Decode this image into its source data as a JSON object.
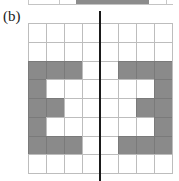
{
  "figure": {
    "label": "(b)",
    "colors": {
      "filled": "#8a8a8a",
      "empty": "#ffffff",
      "grid_line": "#bdbdbd",
      "symmetry_axis": "#1a1a1a"
    },
    "top_partial_panel": {
      "description": "bottom edge of previous panel (a) grid",
      "filled_span_px": [
        76,
        149
      ]
    },
    "grid": {
      "rows": 8,
      "cols": 8,
      "cells": [
        [
          0,
          0,
          0,
          0,
          0,
          0,
          0,
          0
        ],
        [
          0,
          0,
          0,
          0,
          0,
          0,
          0,
          0
        ],
        [
          1,
          1,
          1,
          0,
          0,
          1,
          1,
          1
        ],
        [
          1,
          0,
          0,
          0,
          0,
          0,
          0,
          1
        ],
        [
          1,
          1,
          0,
          0,
          0,
          0,
          1,
          1
        ],
        [
          1,
          0,
          0,
          0,
          0,
          0,
          0,
          1
        ],
        [
          1,
          1,
          1,
          0,
          0,
          1,
          1,
          1
        ],
        [
          0,
          0,
          0,
          0,
          0,
          0,
          0,
          0
        ]
      ]
    },
    "symmetry_axis": "vertical line at center between column 4 and 5"
  }
}
